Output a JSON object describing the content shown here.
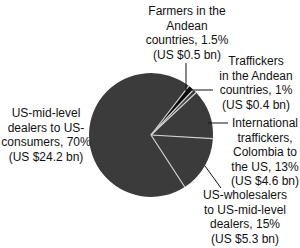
{
  "chart_data": {
    "type": "pie",
    "title": "",
    "categories": [
      "US-mid-level dealers to US-consumers",
      "Farmers in the Andean countries",
      "Traffickers in the Andean countries",
      "International traffickers, Colombia to the US",
      "US-wholesalers to US-mid-level dealers"
    ],
    "values": [
      70,
      1.5,
      1,
      13,
      15
    ],
    "values_usd_bn": [
      24.2,
      0.5,
      0.4,
      4.6,
      5.3
    ],
    "unit": "%",
    "colors": [
      "#3b3b3b",
      "#0a0a0a",
      "#3b3b3b",
      "#3b3b3b",
      "#3b3b3b"
    ],
    "separator_color": "#cfcfcf",
    "legend": "none (direct labels with leader lines)"
  },
  "geometry": {
    "cx": 151,
    "cy": 135,
    "r": 62,
    "start_angle_deg": 147
  },
  "labels": [
    {
      "key": "us_mid_level",
      "lines": [
        "US-mid-level",
        "dealers to US-",
        "consumers, 70%",
        "(US $24.2 bn)"
      ],
      "x": 46,
      "y": 106
    },
    {
      "key": "farmers",
      "lines": [
        "Farmers in the",
        "Andean",
        "countries, 1.5%",
        "(US $0.5 bn)"
      ],
      "x": 187,
      "y": 4
    },
    {
      "key": "traffickers",
      "lines": [
        "Traffickers",
        "in the Andean",
        "countries, 1%",
        "(US $0.4 bn)"
      ],
      "x": 256,
      "y": 54
    },
    {
      "key": "international",
      "lines": [
        "International",
        "traffickers,",
        "Colombia to",
        "the US, 13%",
        "(US $4.6 bn)"
      ],
      "x": 265,
      "y": 116
    },
    {
      "key": "wholesalers",
      "lines": [
        "US-wholesalers",
        "to US-mid-level",
        "dealers, 15%",
        "(US $5.3 bn)"
      ],
      "x": 245,
      "y": 188
    }
  ],
  "leaders": [
    {
      "key": "farmers",
      "x1": 186,
      "y1": 63,
      "x2": 186,
      "y2": 90
    },
    {
      "key": "traffickers",
      "x1": 185,
      "y1": 90,
      "x2": 213,
      "y2": 90
    },
    {
      "key": "international",
      "x1": 208,
      "y1": 123,
      "x2": 228,
      "y2": 123
    },
    {
      "key": "wholesalers",
      "x1": 205,
      "y1": 166,
      "x2": 221,
      "y2": 188
    }
  ]
}
